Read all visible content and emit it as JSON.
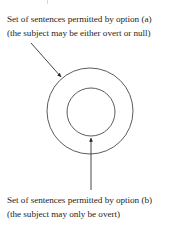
{
  "figure": {
    "type": "venn-nested-circles",
    "background_color": "#ffffff",
    "stroke_color": "#222222",
    "caption_top": {
      "line1": "Set of sentences permitted by option (a)",
      "line2": "(the subject may be either overt or null)"
    },
    "caption_bottom": {
      "line1": "Set of sentences permitted by option (b)",
      "line2": "(the subject may only be overt)"
    },
    "shapes": {
      "outer_circle": {
        "label": "outer-circle",
        "cx": 90,
        "cy": 111,
        "r": 43
      },
      "inner_circle": {
        "label": "inner-circle",
        "cx": 91,
        "cy": 112,
        "r": 24
      }
    },
    "annotations": {
      "arrow_to_outer": {
        "label": "arrow-pointing-to-outer-circle",
        "from_x": 31,
        "from_y": 43,
        "to_x": 62,
        "to_y": 78
      },
      "arrow_to_inner": {
        "label": "arrow-pointing-to-inner-circle",
        "from_x": 91,
        "from_y": 190,
        "to_x": 91,
        "to_y": 135
      }
    }
  }
}
